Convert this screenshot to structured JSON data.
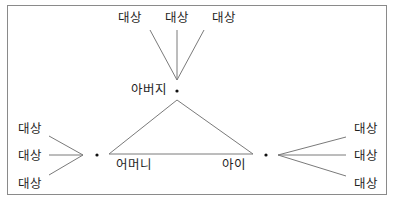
{
  "diagram": {
    "nodes": {
      "father": {
        "label": "아버지"
      },
      "mother": {
        "label": "어머니"
      },
      "child": {
        "label": "아이"
      }
    },
    "targets": {
      "father": [
        "대상",
        "대상",
        "대상"
      ],
      "mother": [
        "대상",
        "대상",
        "대상"
      ],
      "child": [
        "대상",
        "대상",
        "대상"
      ]
    },
    "colors": {
      "line": "#7a7a7a",
      "text": "#1e1e1e",
      "border": "#8a8a8a",
      "dot": "#111111"
    }
  }
}
